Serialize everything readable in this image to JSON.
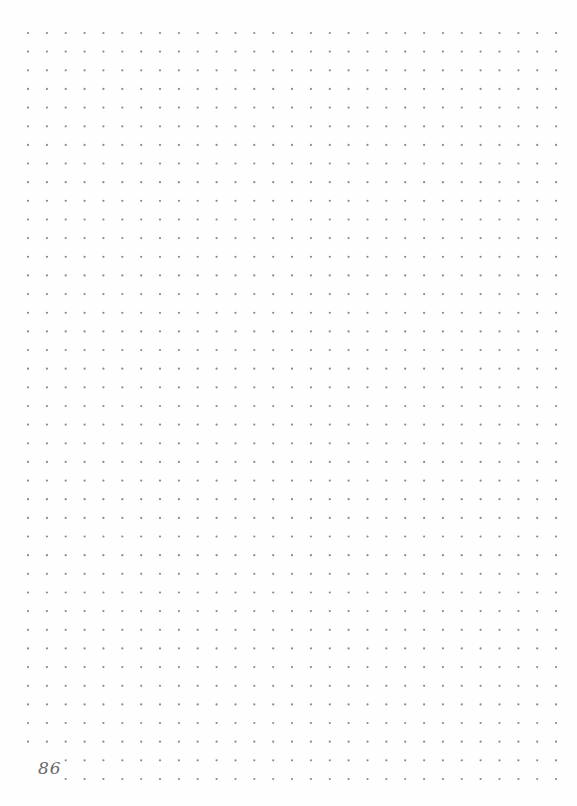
{
  "page": {
    "type": "dot-grid notebook page",
    "background": "#fefefe",
    "page_number": "86"
  },
  "grid": {
    "columns": 29,
    "rows": 41,
    "origin_x": 28,
    "origin_y": 33,
    "spacing_x": 18.86,
    "spacing_y": 18.65,
    "dot_radius": 1.1,
    "dot_color": "#8a8a8a",
    "skipped_dots": [
      [
        39,
        0
      ],
      [
        39,
        1
      ],
      [
        40,
        0
      ],
      [
        40,
        1
      ]
    ]
  }
}
